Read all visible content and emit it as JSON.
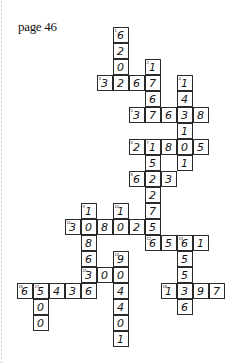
{
  "page": {
    "label": "page 46"
  },
  "grid": {
    "cell_size": 16,
    "cells": [
      {
        "x": 113,
        "y": 27,
        "v": "6",
        "n": "1"
      },
      {
        "x": 113,
        "y": 43,
        "v": "2"
      },
      {
        "x": 113,
        "y": 59,
        "v": "0"
      },
      {
        "x": 145,
        "y": 59,
        "v": "1",
        "n": "2"
      },
      {
        "x": 97,
        "y": 75,
        "v": "3",
        "n": "3"
      },
      {
        "x": 113,
        "y": 75,
        "v": "2"
      },
      {
        "x": 129,
        "y": 75,
        "v": "6"
      },
      {
        "x": 145,
        "y": 75,
        "v": "7"
      },
      {
        "x": 177,
        "y": 75,
        "v": "1",
        "n": "4"
      },
      {
        "x": 145,
        "y": 91,
        "v": "6"
      },
      {
        "x": 177,
        "y": 91,
        "v": "4"
      },
      {
        "x": 129,
        "y": 107,
        "v": "3",
        "n": "5"
      },
      {
        "x": 145,
        "y": 107,
        "v": "7"
      },
      {
        "x": 161,
        "y": 107,
        "v": "6"
      },
      {
        "x": 177,
        "y": 107,
        "v": "3"
      },
      {
        "x": 193,
        "y": 107,
        "v": "8"
      },
      {
        "x": 177,
        "y": 123,
        "v": "1"
      },
      {
        "x": 129,
        "y": 139,
        "v": "2",
        "n": "6"
      },
      {
        "x": 145,
        "y": 139,
        "v": "1",
        "n": "7"
      },
      {
        "x": 161,
        "y": 139,
        "v": "8"
      },
      {
        "x": 177,
        "y": 139,
        "v": "0"
      },
      {
        "x": 193,
        "y": 139,
        "v": "5"
      },
      {
        "x": 145,
        "y": 155,
        "v": "5"
      },
      {
        "x": 177,
        "y": 155,
        "v": "1"
      },
      {
        "x": 129,
        "y": 171,
        "v": "6",
        "n": "8"
      },
      {
        "x": 145,
        "y": 171,
        "v": "2"
      },
      {
        "x": 161,
        "y": 171,
        "v": "3"
      },
      {
        "x": 145,
        "y": 187,
        "v": "2"
      },
      {
        "x": 81,
        "y": 203,
        "v": "1",
        "n": "9"
      },
      {
        "x": 113,
        "y": 203,
        "v": "1",
        "n": "10"
      },
      {
        "x": 145,
        "y": 203,
        "v": "7"
      },
      {
        "x": 65,
        "y": 219,
        "v": "3",
        "n": "11"
      },
      {
        "x": 81,
        "y": 219,
        "v": "0"
      },
      {
        "x": 97,
        "y": 219,
        "v": "8"
      },
      {
        "x": 113,
        "y": 219,
        "v": "0"
      },
      {
        "x": 129,
        "y": 219,
        "v": "2"
      },
      {
        "x": 145,
        "y": 219,
        "v": "5"
      },
      {
        "x": 81,
        "y": 235,
        "v": "8"
      },
      {
        "x": 145,
        "y": 235,
        "v": "6",
        "n": "12"
      },
      {
        "x": 161,
        "y": 235,
        "v": "5"
      },
      {
        "x": 177,
        "y": 235,
        "v": "6",
        "n": "13"
      },
      {
        "x": 193,
        "y": 235,
        "v": "1"
      },
      {
        "x": 81,
        "y": 251,
        "v": "6"
      },
      {
        "x": 113,
        "y": 251,
        "v": "9",
        "n": "14"
      },
      {
        "x": 177,
        "y": 251,
        "v": "5"
      },
      {
        "x": 81,
        "y": 267,
        "v": "3",
        "n": "15"
      },
      {
        "x": 97,
        "y": 267,
        "v": "0"
      },
      {
        "x": 113,
        "y": 267,
        "v": "0"
      },
      {
        "x": 177,
        "y": 267,
        "v": "5"
      },
      {
        "x": 17,
        "y": 283,
        "v": "6",
        "n": "16"
      },
      {
        "x": 33,
        "y": 283,
        "v": "5",
        "n": "17"
      },
      {
        "x": 49,
        "y": 283,
        "v": "4"
      },
      {
        "x": 65,
        "y": 283,
        "v": "3"
      },
      {
        "x": 81,
        "y": 283,
        "v": "6"
      },
      {
        "x": 113,
        "y": 283,
        "v": "4"
      },
      {
        "x": 161,
        "y": 283,
        "v": "1",
        "n": "18"
      },
      {
        "x": 177,
        "y": 283,
        "v": "3"
      },
      {
        "x": 193,
        "y": 283,
        "v": "9"
      },
      {
        "x": 209,
        "y": 283,
        "v": "7"
      },
      {
        "x": 33,
        "y": 299,
        "v": "0"
      },
      {
        "x": 113,
        "y": 299,
        "v": "4"
      },
      {
        "x": 177,
        "y": 299,
        "v": "6"
      },
      {
        "x": 33,
        "y": 315,
        "v": "0"
      },
      {
        "x": 113,
        "y": 315,
        "v": "0"
      },
      {
        "x": 113,
        "y": 331,
        "v": "1"
      }
    ]
  }
}
